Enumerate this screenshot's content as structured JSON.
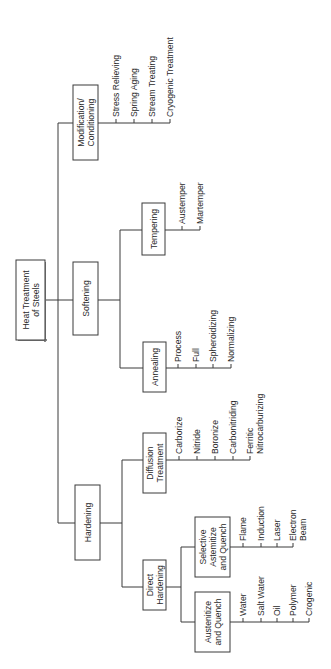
{
  "diagram": {
    "orientation": "rotated-90-ccw",
    "colors": {
      "line": "#3a3a3a",
      "text": "#2a2a2a",
      "background": "#ffffff"
    },
    "root": {
      "lines": [
        "Heat Treatment",
        "of Steels"
      ]
    },
    "categories": [
      {
        "id": "modification",
        "lines": [
          "Modification/",
          "Conditioning"
        ],
        "leaves": [
          "Stress Relieving",
          "Spring Aging",
          "Stream Treating",
          "Cryogenic Treatment"
        ]
      },
      {
        "id": "softening",
        "lines": [
          "Softening"
        ],
        "children": [
          {
            "id": "tempering",
            "lines": [
              "Tempering"
            ],
            "leaves": [
              "Austemper",
              "Martemper"
            ]
          },
          {
            "id": "annealing",
            "lines": [
              "Annealing"
            ],
            "leaves": [
              "Process",
              "Full",
              "Spheroidizing",
              "Normalizing"
            ]
          }
        ]
      },
      {
        "id": "hardening",
        "lines": [
          "Hardening"
        ],
        "children": [
          {
            "id": "diffusion",
            "lines": [
              "Diffusion",
              "Treatment"
            ],
            "leaves": [
              "Carborize",
              "Nitride",
              "Boronize",
              "Carbonitriding",
              [
                "Ferritic",
                "Nitrocarburizing"
              ]
            ]
          },
          {
            "id": "direct",
            "lines": [
              "Direct",
              "Hardening"
            ],
            "children": [
              {
                "id": "selective",
                "lines": [
                  "Selective",
                  "Astemitize",
                  "and Quench"
                ],
                "leaves": [
                  "Flame",
                  "Induction",
                  "Laser",
                  [
                    "Electron",
                    "Beam"
                  ]
                ]
              },
              {
                "id": "austenitize",
                "lines": [
                  "Austenitize",
                  "and Quench"
                ],
                "leaves": [
                  "Water",
                  "Salt Water",
                  "Oil",
                  "Polymer",
                  "Crogenic"
                ]
              }
            ]
          }
        ]
      }
    ]
  }
}
